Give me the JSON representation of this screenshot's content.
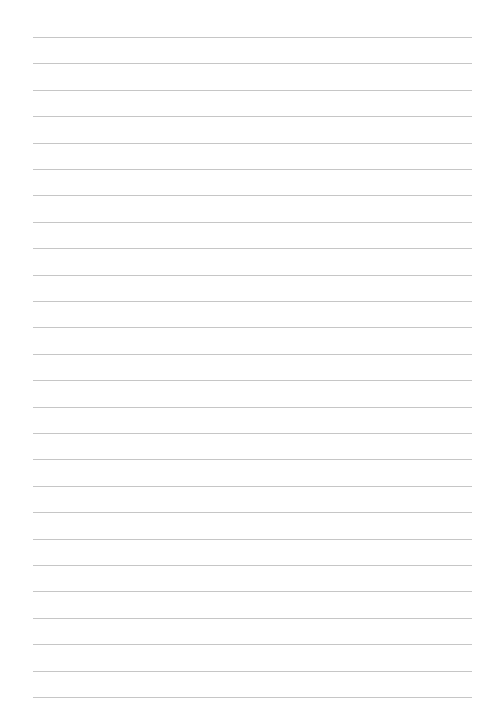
{
  "page": {
    "type": "lined-paper",
    "background": "#ffffff",
    "rule_color": "#c6c6c6",
    "rule_count": 26,
    "first_rule_y": 37,
    "rule_spacing": 26.4,
    "rule_left": 33,
    "rule_right": 472
  }
}
